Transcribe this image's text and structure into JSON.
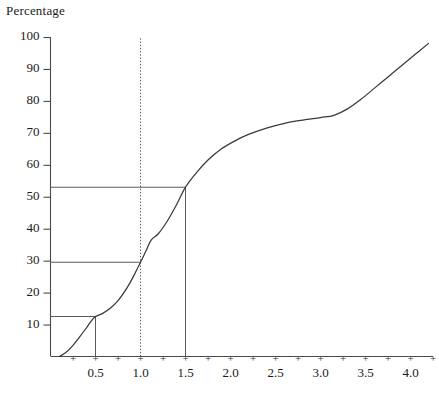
{
  "chart_data": {
    "type": "line",
    "title": "Percentage",
    "xlabel": "",
    "ylabel": "Percentage",
    "xlim": [
      0.0,
      4.25
    ],
    "ylim": [
      0,
      100
    ],
    "grid": false,
    "legend": null,
    "y_ticks": [
      10,
      20,
      30,
      40,
      50,
      60,
      70,
      80,
      90,
      100
    ],
    "y_tick_labels": [
      "10",
      "20",
      "30",
      "40",
      "50",
      "60",
      "70",
      "80",
      "90",
      "100"
    ],
    "x_ticks": [
      0.25,
      0.5,
      0.75,
      1.0,
      1.25,
      1.5,
      1.75,
      2.0,
      2.25,
      2.5,
      2.75,
      3.0,
      3.25,
      3.5,
      3.75,
      4.0,
      4.25
    ],
    "x_tick_glyph": "+",
    "x_tick_labels": [
      "0.5",
      "1.0",
      "1.5",
      "2.0",
      "2.5",
      "3.0",
      "3.5",
      "4.0"
    ],
    "x_tick_label_values": [
      0.5,
      1.0,
      1.5,
      2.0,
      2.5,
      3.0,
      3.5,
      4.0
    ],
    "x": [
      0.1,
      0.18,
      0.25,
      0.32,
      0.4,
      0.45,
      0.5,
      0.58,
      0.66,
      0.75,
      0.85,
      0.92,
      1.0,
      1.06,
      1.12,
      1.2,
      1.3,
      1.4,
      1.5,
      1.62,
      1.75,
      1.9,
      2.05,
      2.2,
      2.4,
      2.6,
      2.8,
      3.0,
      3.15,
      3.3,
      3.45,
      3.6,
      3.75,
      3.9,
      4.05,
      4.2
    ],
    "y": [
      0.0,
      1.5,
      3.5,
      6.0,
      9.0,
      11.0,
      12.5,
      13.5,
      15.0,
      17.5,
      21.5,
      25.0,
      29.5,
      33.0,
      36.5,
      38.5,
      42.5,
      47.5,
      53.0,
      57.5,
      61.5,
      65.0,
      67.5,
      69.5,
      71.5,
      73.0,
      74.0,
      74.8,
      75.5,
      77.5,
      80.5,
      84.0,
      87.5,
      91.0,
      94.5,
      98.0
    ],
    "annotations": [
      {
        "name": "reference-line-vertical-dotted",
        "kind": "vline",
        "style": "dotted",
        "x": 1.0,
        "from_y": 0,
        "to_y": 100
      },
      {
        "name": "drop-line-x-0-5",
        "kind": "vline",
        "style": "solid",
        "x": 0.5,
        "from_y": 0,
        "to_y": 12.5
      },
      {
        "name": "drop-line-x-1-5",
        "kind": "vline",
        "style": "solid",
        "x": 1.5,
        "from_y": 0,
        "to_y": 53.0
      },
      {
        "name": "guide-line-y-12-5",
        "kind": "hline",
        "style": "solid",
        "y": 12.5,
        "from_x": 0.0,
        "to_x": 0.5
      },
      {
        "name": "guide-line-y-29-5",
        "kind": "hline",
        "style": "solid",
        "y": 29.5,
        "from_x": 0.0,
        "to_x": 1.0
      },
      {
        "name": "guide-line-y-53",
        "kind": "hline",
        "style": "solid",
        "y": 53.0,
        "from_x": 0.0,
        "to_x": 1.5
      }
    ],
    "read_off_values": [
      {
        "x": 0.5,
        "y": 12.5
      },
      {
        "x": 1.0,
        "y": 29.5
      },
      {
        "x": 1.5,
        "y": 53.0
      }
    ]
  },
  "caption": {
    "text": ""
  },
  "colors": {
    "curve": "#3a3a3a",
    "axis": "#4a4a4a",
    "guide": "#5a5a5a",
    "text": "#1a1a1a",
    "background": "#ffffff"
  }
}
